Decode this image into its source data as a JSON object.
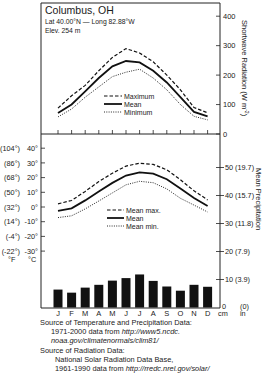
{
  "station": {
    "name": "Columbus, OH",
    "coords": "Lat 40.00°N — Long 82.88°W",
    "elevation": "Elev. 254 m"
  },
  "months": [
    "J",
    "F",
    "M",
    "A",
    "M",
    "J",
    "J",
    "A",
    "S",
    "O",
    "N",
    "D"
  ],
  "sources": {
    "temp_precip_heading": "Source of Temperature and Precipitation Data:",
    "temp_precip_line1_prefix": "1971-2000 data from ",
    "temp_precip_line1_url": "http://www5.ncdc.",
    "temp_precip_line2_url": "noaa.gov/climatenormals/clim81/",
    "radiation_heading": "Source of Radiation Data:",
    "radiation_line1": "National Solar Radiation Data Base,",
    "radiation_line2_prefix": "1961-1990 data from ",
    "radiation_line2_url": "http://rredc.nrel.gov/solar/"
  },
  "chart_data": [
    {
      "type": "line",
      "title": "Shortwave Radiation",
      "ylabel": "Shortwave Radiation (W m-2)",
      "ylabel_main": "Shortwave Radiation (W m",
      "ylabel_sup": "-2",
      "ylabel_close": ")",
      "ylim": [
        0,
        400
      ],
      "yticks": [
        0,
        100,
        200,
        300,
        400
      ],
      "categories": [
        "J",
        "F",
        "M",
        "A",
        "M",
        "J",
        "J",
        "A",
        "S",
        "O",
        "N",
        "D"
      ],
      "legend": [
        "Maximum",
        "Mean",
        "Minimum"
      ],
      "series": [
        {
          "name": "Maximum",
          "style": "dashed",
          "values": [
            88,
            130,
            165,
            215,
            260,
            290,
            275,
            245,
            200,
            150,
            90,
            72
          ]
        },
        {
          "name": "Mean",
          "style": "solid",
          "values": [
            71,
            100,
            145,
            190,
            230,
            248,
            243,
            215,
            175,
            125,
            75,
            60
          ]
        },
        {
          "name": "Minimum",
          "style": "dotted",
          "values": [
            58,
            85,
            125,
            160,
            195,
            210,
            220,
            190,
            150,
            100,
            60,
            48
          ]
        }
      ]
    },
    {
      "type": "line",
      "title": "Temperature",
      "ylabel": "°C",
      "ylabel_alt": "°F",
      "ylim": [
        -30,
        40
      ],
      "yticks_c": [
        "40°",
        "30°",
        "20°",
        "10°",
        "0°",
        "-10°",
        "-20°",
        "-30°"
      ],
      "yticks_f": [
        "(104°)",
        "(86°)",
        "(68°)",
        "(50°)",
        "(32°)",
        "(14°)",
        "(-4°)",
        "(-22°)"
      ],
      "categories": [
        "J",
        "F",
        "M",
        "A",
        "M",
        "J",
        "J",
        "A",
        "S",
        "O",
        "N",
        "D"
      ],
      "legend": [
        "Mean max.",
        "Mean",
        "Mean min."
      ],
      "series": [
        {
          "name": "Mean max.",
          "style": "dashed",
          "values": [
            2.2,
            4.4,
            10.6,
            17.3,
            23.0,
            27.8,
            29.8,
            29.0,
            25.3,
            18.6,
            11.0,
            4.8
          ]
        },
        {
          "name": "Mean",
          "style": "solid",
          "values": [
            -2.6,
            -0.9,
            4.5,
            10.6,
            16.4,
            21.4,
            23.6,
            22.7,
            18.9,
            12.5,
            6.1,
            0.6
          ]
        },
        {
          "name": "Mean min.",
          "style": "dotted",
          "values": [
            -7.2,
            -6.0,
            -1.3,
            4.1,
            9.6,
            15.1,
            17.5,
            16.5,
            12.3,
            5.9,
            1.3,
            -3.4
          ]
        }
      ]
    },
    {
      "type": "bar",
      "title": "Mean Precipitation",
      "ylabel": "Mean Precipitation",
      "ylim": [
        0,
        55
      ],
      "yticks_cm": [
        "0",
        "10",
        "20",
        "30",
        "40",
        "50"
      ],
      "yticks_in": [
        "(0)",
        "(3.9)",
        "(7.9)",
        "(11.8)",
        "(15.7)",
        "(19.7)"
      ],
      "unit_cm": "cm",
      "unit_in": "in",
      "categories": [
        "J",
        "F",
        "M",
        "A",
        "M",
        "J",
        "J",
        "A",
        "S",
        "O",
        "N",
        "D"
      ],
      "values": [
        6.4,
        5.3,
        7.1,
        8.1,
        9.6,
        10.5,
        11.8,
        9.5,
        7.5,
        6.0,
        8.1,
        7.4
      ]
    }
  ]
}
